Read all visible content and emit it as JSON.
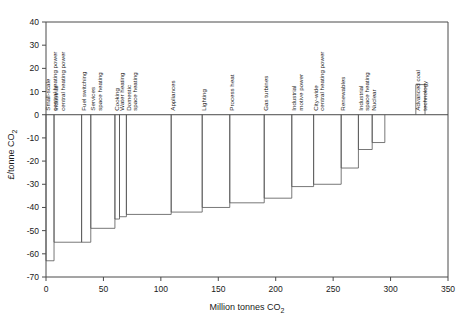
{
  "chart_data": {
    "type": "bar",
    "title": "",
    "xlabel": "Million tonnes CO2",
    "ylabel": "£/tonne CO2",
    "xlabel_parts": {
      "main": "Million tonnes CO",
      "sub": "2"
    },
    "ylabel_parts": {
      "main": "£/tonne CO",
      "sub": "2"
    },
    "xlim": [
      0,
      350
    ],
    "ylim": [
      -70,
      40
    ],
    "xticks": [
      0,
      50,
      100,
      150,
      200,
      250,
      300,
      350
    ],
    "yticks": [
      40,
      30,
      20,
      10,
      0,
      -10,
      -20,
      -30,
      -40,
      -50,
      -60,
      -70
    ],
    "grid": false,
    "legend": "none",
    "orientation": "marginal-abatement-cost-curve",
    "categories": [
      "Small-scale central heating power",
      "Industrial central heating power",
      "Fuel switching",
      "Services space heating",
      "Cooking",
      "Water heating",
      "Domestic space heating",
      "Appliances",
      "Lighting",
      "Process heat",
      "Gas turbines",
      "Industrial motive power",
      "City-wide central heating power",
      "Renewables",
      "Industrial space heating",
      "Nuclear",
      "Advanced coal technology"
    ],
    "values": [
      -63,
      -55,
      -55,
      -49,
      -45,
      -44,
      -43,
      -42,
      -40,
      -38,
      -36,
      -31,
      -30,
      -23,
      -15,
      -12,
      13
    ],
    "widths": [
      7,
      24,
      8,
      21,
      4,
      6,
      39,
      27,
      24,
      30,
      24,
      19,
      24,
      15,
      12,
      11,
      8
    ],
    "bars": [
      {
        "label": "Small-scale central heating power",
        "x_start": 0,
        "x_end": 7,
        "width": 7,
        "value": -63
      },
      {
        "label": "Industrial central heating power",
        "x_start": 7,
        "x_end": 31,
        "width": 24,
        "value": -55
      },
      {
        "label": "Fuel switching",
        "x_start": 31,
        "x_end": 39,
        "width": 8,
        "value": -55
      },
      {
        "label": "Services space heating",
        "x_start": 39,
        "x_end": 60,
        "width": 21,
        "value": -49
      },
      {
        "label": "Cooking",
        "x_start": 60,
        "x_end": 64,
        "width": 4,
        "value": -45
      },
      {
        "label": "Water heating",
        "x_start": 64,
        "x_end": 70,
        "width": 6,
        "value": -44
      },
      {
        "label": "Domestic space heating",
        "x_start": 70,
        "x_end": 109,
        "width": 39,
        "value": -43
      },
      {
        "label": "Appliances",
        "x_start": 109,
        "x_end": 136,
        "width": 27,
        "value": -42
      },
      {
        "label": "Lighting",
        "x_start": 136,
        "x_end": 160,
        "width": 24,
        "value": -40
      },
      {
        "label": "Process heat",
        "x_start": 160,
        "x_end": 190,
        "width": 30,
        "value": -38
      },
      {
        "label": "Gas turbines",
        "x_start": 190,
        "x_end": 214,
        "width": 24,
        "value": -36
      },
      {
        "label": "Industrial motive power",
        "x_start": 214,
        "x_end": 233,
        "width": 19,
        "value": -31
      },
      {
        "label": "City-wide central heating power",
        "x_start": 233,
        "x_end": 257,
        "width": 24,
        "value": -30
      },
      {
        "label": "Renewables",
        "x_start": 257,
        "x_end": 272,
        "width": 15,
        "value": -23
      },
      {
        "label": "Industrial space heating",
        "x_start": 272,
        "x_end": 284,
        "width": 12,
        "value": -15
      },
      {
        "label": "Nuclear",
        "x_start": 284,
        "x_end": 295,
        "width": 11,
        "value": -12
      },
      {
        "label": "Advanced coal technology",
        "x_start": 322,
        "x_end": 330,
        "width": 8,
        "value": 13
      }
    ]
  }
}
